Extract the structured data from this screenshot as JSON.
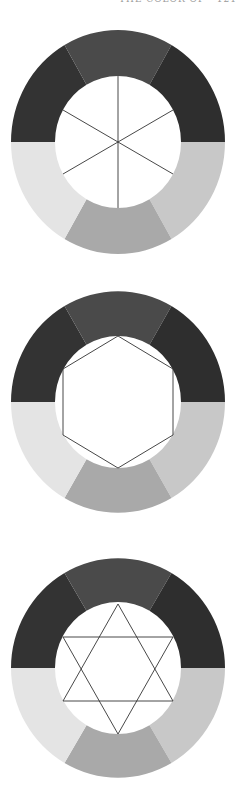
{
  "page": {
    "running_head": "THE COLOR OF  ·  121",
    "running_head_note": "clipped at top edge; glyphs partially visible"
  },
  "wheel_colors": {
    "top_left": "#333333",
    "top": "#4a4a4a",
    "top_right": "#2e2e2e",
    "bottom_right": "#c8c8c8",
    "bottom": "#a9a9a9",
    "bottom_left": "#e4e4e4",
    "line": "#333333",
    "inner": "#ffffff"
  },
  "figures": [
    {
      "id": "wheel-spokes",
      "center": [
        118,
        142
      ],
      "overlay": "spokes"
    },
    {
      "id": "wheel-hexagon",
      "center": [
        118,
        402
      ],
      "overlay": "hexagon"
    },
    {
      "id": "wheel-star",
      "center": [
        118,
        668
      ],
      "overlay": "hexagram"
    }
  ]
}
